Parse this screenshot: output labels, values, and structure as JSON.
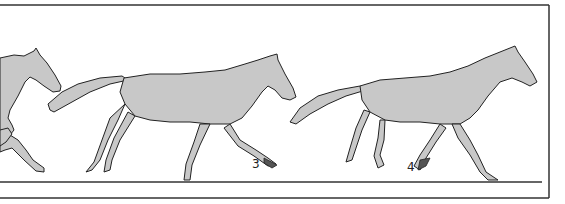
{
  "figure": {
    "frames": [
      {
        "index": 2,
        "label": ""
      },
      {
        "index": 3,
        "label": "3"
      },
      {
        "index": 4,
        "label": "4"
      }
    ]
  },
  "colors": {
    "horse_fill": "#c8c8c8",
    "outline": "#222222",
    "hoof": "#555555",
    "background": "#ffffff"
  }
}
